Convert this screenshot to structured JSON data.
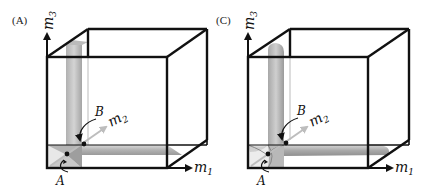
{
  "panels": [
    {
      "id": "A",
      "label": "(A)",
      "axes": {
        "x": "m",
        "x_sub": "1",
        "y": "m",
        "y_sub": "2",
        "z": "m",
        "z_sub": "3"
      },
      "points": {
        "A": "A",
        "B": "B"
      },
      "shape": "flat-planes"
    },
    {
      "id": "C",
      "label": "(C)",
      "axes": {
        "x": "m",
        "x_sub": "1",
        "y": "m",
        "y_sub": "2",
        "z": "m",
        "z_sub": "3"
      },
      "points": {
        "A": "A",
        "B": "B"
      },
      "shape": "rounded-tubes"
    }
  ],
  "colors": {
    "edge": "#111111",
    "surface_dark": "#8c8c8c",
    "surface_light": "#d9d9d9",
    "m2_axis": "#bdbdbd"
  }
}
